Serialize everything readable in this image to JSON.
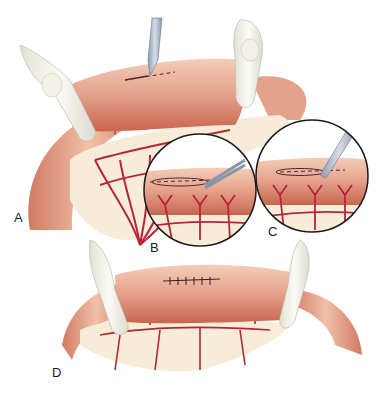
{
  "figure": {
    "panels": [
      {
        "id": "A",
        "label": "A",
        "content": "Bowel loop held between two fingers; scalpel making incision along dashed line on antimesenteric border; mesenteric vessels visible"
      },
      {
        "id": "B",
        "label": "B",
        "content": "Circular inset: scissors extending the incision along dashed line"
      },
      {
        "id": "C",
        "label": "C",
        "content": "Circular inset: scalpel incising along dashed line"
      },
      {
        "id": "D",
        "label": "D",
        "content": "Bowel loop held between two fingers with incision closed by interrupted sutures"
      }
    ],
    "colors": {
      "bowel": "#d9826a",
      "bowel_highlight": "#f2c4ae",
      "vessel": "#b8243a",
      "mesentery": "#f6ecd8",
      "glove": "#f1f0e6",
      "instrument": "#a8b4c4",
      "outline": "#1a1a1a"
    }
  }
}
